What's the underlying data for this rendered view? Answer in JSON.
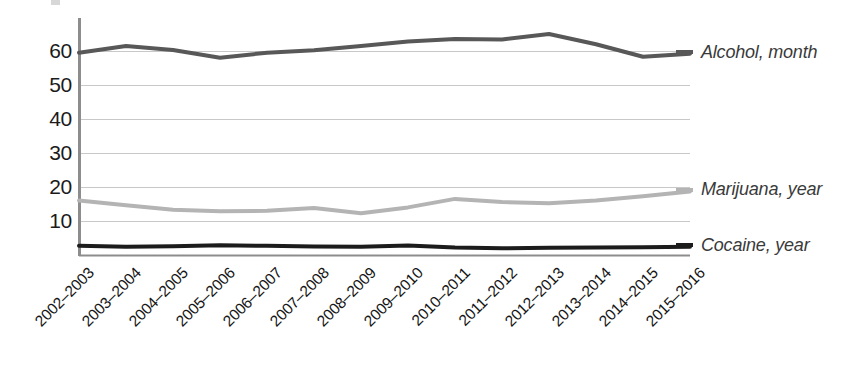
{
  "chart_data": {
    "type": "line",
    "title": "",
    "subtitle": "",
    "xlabel": "",
    "ylabel": "",
    "grid": true,
    "legend_position": "right",
    "ylim": [
      0,
      68
    ],
    "yticks": [
      10,
      20,
      30,
      40,
      50,
      60
    ],
    "ytick_labels": [
      "10",
      "20",
      "30",
      "40",
      "50",
      "60"
    ],
    "categories": [
      "2002–2003",
      "2003–2004",
      "2004–2005",
      "2005–2006",
      "2006–2007",
      "2007–2008",
      "2008–2009",
      "2009–2010",
      "2010–2011",
      "2011–2012",
      "2012–2013",
      "2013–2014",
      "2014–2015",
      "2015–2016"
    ],
    "series": [
      {
        "name": "Alcohol, month",
        "color": "#585858",
        "values": [
          59.5,
          61.5,
          60.3,
          58.0,
          59.5,
          60.2,
          61.5,
          62.8,
          63.5,
          63.4,
          65.0,
          62.0,
          58.3,
          59.2
        ]
      },
      {
        "name": "Marijuana, year",
        "color": "#b4b4b4",
        "values": [
          16.0,
          14.6,
          13.3,
          12.9,
          13.0,
          13.8,
          12.3,
          14.0,
          16.5,
          15.6,
          15.2,
          16.0,
          17.3,
          18.7
        ]
      },
      {
        "name": "Cocaine, year",
        "color": "#1c1c1c",
        "values": [
          2.7,
          2.4,
          2.6,
          2.9,
          2.7,
          2.5,
          2.4,
          2.8,
          2.2,
          2.0,
          2.1,
          2.2,
          2.3,
          2.4
        ]
      }
    ]
  },
  "legend": {
    "items": [
      {
        "label": "Alcohol, month",
        "color": "#585858"
      },
      {
        "label": "Marijuana, year",
        "color": "#b4b4b4"
      },
      {
        "label": "Cocaine, year",
        "color": "#1c1c1c"
      }
    ]
  },
  "axes": {
    "axis_color": "#8d8d8d",
    "grid_color": "#c8c8c8",
    "tick_text_color": "#1b1b1b"
  }
}
